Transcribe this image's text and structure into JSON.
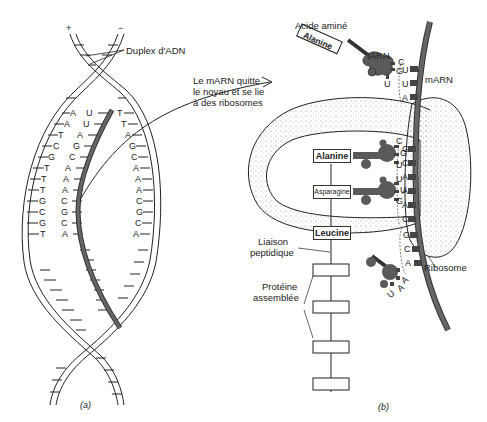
{
  "figure": {
    "panel_a_label": "(a)",
    "panel_b_label": "(b)"
  },
  "panel_a": {
    "strand_plus": "+",
    "strand_minus": "−",
    "duplex_label": "Duplex d'ADN",
    "left_strand_bases": [
      "A",
      "A",
      "T",
      "C",
      "G",
      "T",
      "T",
      "T",
      "G",
      "C",
      "G",
      "T"
    ],
    "mrna_bases": [
      "U",
      "U",
      "A",
      "G",
      "C",
      "A",
      "A",
      "A",
      "C",
      "G",
      "C",
      "A"
    ],
    "right_strand_bases": [
      "T",
      "T",
      "A",
      "G",
      "C",
      "A",
      "A",
      "A",
      "C",
      "G",
      "C",
      "A"
    ]
  },
  "arrow_note": {
    "line1": "Le mARN quitte",
    "line2": "le noyau et se lie",
    "line3": "à des ribosomes"
  },
  "panel_b": {
    "amino_acid_label": "Acide aminé",
    "trna_label": "tARN",
    "mrna_label": "mARN",
    "ribosome_label": "Ribosome",
    "peptide_bond_label_1": "Liaison",
    "peptide_bond_label_2": "peptidique",
    "protein_label_1": "Protéine",
    "protein_label_2": "assemblée",
    "incoming_trna": {
      "amino_acid": "Alanine",
      "anticodon": [
        "C",
        "G",
        "U"
      ],
      "codon": [
        "U",
        "U",
        "A"
      ]
    },
    "bound_trnas": [
      {
        "amino_acid": "Alanine",
        "anticodon": [
          "C",
          "G",
          "U"
        ],
        "codon": [
          "G",
          "C",
          "A"
        ]
      },
      {
        "amino_acid": "Asparagine",
        "anticodon": [
          "U",
          "U",
          "G"
        ],
        "codon": [
          "A",
          "A",
          "C"
        ]
      }
    ],
    "chain_top": "Leucine",
    "outgoing_trna": {
      "anticodon": [
        "A",
        "A",
        "U"
      ],
      "codon": [
        "G",
        "C",
        "A"
      ]
    }
  },
  "colors": {
    "ink": "#222222",
    "mrna_fill": "#555555",
    "trna_fill": "#5a5a5a",
    "ribosome_stipple": "#9a9a9a"
  }
}
